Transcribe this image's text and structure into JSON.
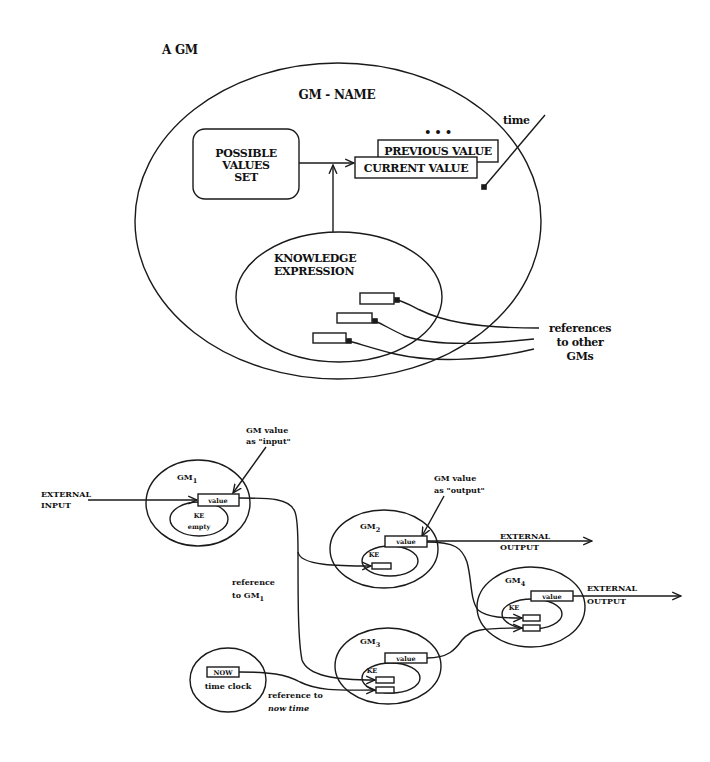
{
  "figure": {
    "top": {
      "title": "A GM",
      "gm_name": "GM - NAME",
      "possible_values_set": [
        "POSSIBLE",
        "VALUES",
        "SET"
      ],
      "previous_value": "PREVIOUS VALUE",
      "current_value": "CURRENT VALUE",
      "ellipsis": "• • •",
      "time_label": "time",
      "knowledge_expression": [
        "KNOWLEDGE",
        "EXPRESSION"
      ],
      "references_label": [
        "references",
        "to other",
        "GMs"
      ]
    },
    "bottom": {
      "gm_value_input": [
        "GM value",
        "as \"input\""
      ],
      "gm_value_output": [
        "GM value",
        "as \"output\""
      ],
      "external_input": [
        "EXTERNAL",
        "INPUT"
      ],
      "external_output_gm2": [
        "EXTERNAL",
        "OUTPUT"
      ],
      "external_output_gm4": [
        "EXTERNAL",
        "OUTPUT"
      ],
      "reference_to_gm1": [
        "reference",
        "to GM"
      ],
      "reference_to_gm1_sub": "1",
      "reference_to_now": [
        "reference to",
        "now time"
      ],
      "gm_prefix": "GM",
      "nodes": [
        {
          "id": "gm1",
          "subscript": "1",
          "value_label": "value",
          "ke_label": "KE",
          "ke_note": "empty"
        },
        {
          "id": "gm2",
          "subscript": "2",
          "value_label": "value",
          "ke_label": "KE"
        },
        {
          "id": "gm3",
          "subscript": "3",
          "value_label": "value",
          "ke_label": "KE"
        },
        {
          "id": "gm4",
          "subscript": "4",
          "value_label": "value",
          "ke_label": "KE"
        }
      ],
      "clock": {
        "now_label": "NOW",
        "caption": "time clock"
      }
    }
  }
}
